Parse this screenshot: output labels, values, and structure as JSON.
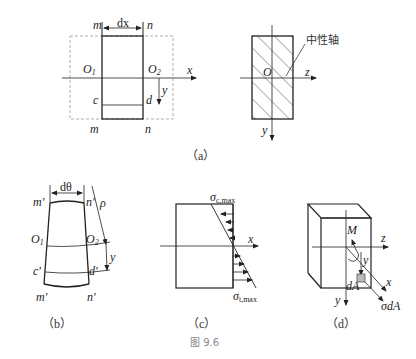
{
  "figure": {
    "caption": "图 9.6"
  },
  "panel_a": {
    "label": "（a）",
    "left": {
      "top_left": "m",
      "top_right": "n",
      "bottom_left": "m",
      "bottom_right": "n",
      "width_label": "dx",
      "o1": "O",
      "o1_sub": "1",
      "o2": "O",
      "o2_sub": "2",
      "axis_x": "x",
      "axis_y": "y",
      "c": "c",
      "d": "d"
    },
    "right": {
      "origin": "O",
      "axis_z": "z",
      "axis_y": "y",
      "neutral_axis": "中性轴"
    }
  },
  "panel_b": {
    "label": "（b）",
    "top_left": "m'",
    "top_right": "n'",
    "bottom_left": "m'",
    "bottom_right": "n'",
    "angle": "dθ",
    "rho": "ρ",
    "o1": "O",
    "o1_sub": "1",
    "o2": "O",
    "o2_sub": "2",
    "c": "c'",
    "d": "d'",
    "y": "y"
  },
  "panel_c": {
    "label": "（c）",
    "axis_x": "x",
    "sigma": "σ",
    "top_sub": "c,max",
    "bottom_sub": "t,max"
  },
  "panel_d": {
    "label": "（d）",
    "moment": "M",
    "axis_z": "z",
    "axis_x": "x",
    "axis_y": "y",
    "y_dist": "y",
    "dA": "dA",
    "force": "σdA"
  }
}
